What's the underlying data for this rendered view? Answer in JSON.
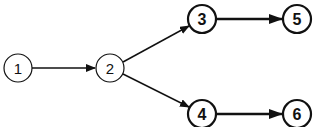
{
  "diagram": {
    "type": "directed-graph",
    "stroke_color": "#111111",
    "background": "#ffffff",
    "nodes": [
      {
        "id": "1",
        "label": "1",
        "cx": 18,
        "cy": 68,
        "r": 14,
        "style": "thin"
      },
      {
        "id": "2",
        "label": "2",
        "cx": 110,
        "cy": 68,
        "r": 14,
        "style": "thin"
      },
      {
        "id": "3",
        "label": "3",
        "cx": 202,
        "cy": 19,
        "r": 14,
        "style": "bold"
      },
      {
        "id": "4",
        "label": "4",
        "cx": 202,
        "cy": 114,
        "r": 14,
        "style": "bold"
      },
      {
        "id": "5",
        "label": "5",
        "cx": 297,
        "cy": 19,
        "r": 14,
        "style": "bold"
      },
      {
        "id": "6",
        "label": "6",
        "cx": 297,
        "cy": 114,
        "r": 14,
        "style": "bold"
      }
    ],
    "edges": [
      {
        "from": "1",
        "to": "2",
        "style": "thin"
      },
      {
        "from": "2",
        "to": "3",
        "style": "thin"
      },
      {
        "from": "2",
        "to": "4",
        "style": "thin"
      },
      {
        "from": "3",
        "to": "5",
        "style": "bold"
      },
      {
        "from": "4",
        "to": "6",
        "style": "bold"
      }
    ]
  }
}
